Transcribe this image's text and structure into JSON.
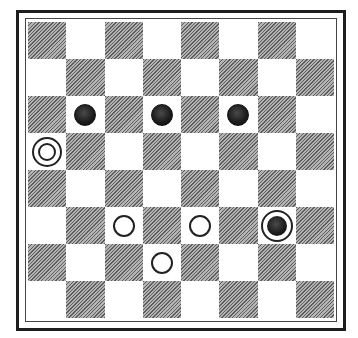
{
  "game": "checkers",
  "board": {
    "rows": 8,
    "cols": 8,
    "dark_on_odd_cols_in_row_1": true,
    "colors": {
      "dark": "#8a8a8a",
      "light": "#ffffff",
      "border": "#1e1e1e"
    }
  },
  "pieces": [
    {
      "type": "black-man",
      "row": 3,
      "col": 2
    },
    {
      "type": "black-man",
      "row": 3,
      "col": 4
    },
    {
      "type": "black-man",
      "row": 3,
      "col": 6
    },
    {
      "type": "white-king",
      "row": 4,
      "col": 1
    },
    {
      "type": "white-man",
      "row": 6,
      "col": 3
    },
    {
      "type": "white-man",
      "row": 6,
      "col": 5
    },
    {
      "type": "black-king",
      "row": 6,
      "col": 7
    },
    {
      "type": "white-man",
      "row": 7,
      "col": 4
    }
  ]
}
